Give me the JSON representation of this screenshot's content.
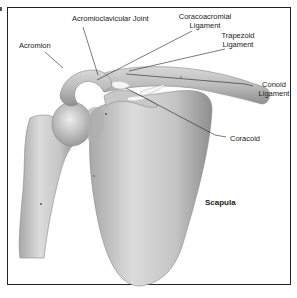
{
  "figure": {
    "colors": {
      "bone_fill": "#c9c9c9",
      "bone_shadow": "#9a9a9a",
      "highlight": "#eeeeee",
      "leader_line": "#222222",
      "border": "#222222"
    }
  },
  "labels": {
    "acromioclavicular_joint": "Acromioclavicular Joint",
    "acromion": "Acromion",
    "coracoacromial_line1": "Coracoacromial",
    "coracoacromial_line2": "Ligament",
    "trapezoid_line1": "Trapezoid",
    "trapezoid_line2": "Ligament",
    "conoid_line1": "Conoid",
    "conoid_line2": "Ligament",
    "coracoid": "Coracoid",
    "scapula": "Scapula"
  }
}
